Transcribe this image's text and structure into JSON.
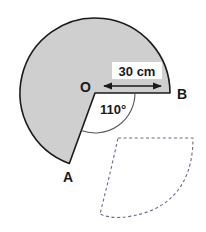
{
  "figure": {
    "background_color": "#ffffff",
    "sector": {
      "fill_color": "#cfcfcf",
      "stroke_color": "#1a1a1a",
      "center_label": "O",
      "start_point_label": "A",
      "end_point_label": "B",
      "radius_cm": 30,
      "removed_angle_degrees": 110,
      "shaded_angle_degrees": 250
    },
    "labels": {
      "center": "O",
      "point_a": "A",
      "point_b": "B",
      "radius_dimension": "30 cm",
      "angle": "110°"
    },
    "dimension_line": {
      "label": "30 cm",
      "from_label": "O",
      "to_label": "B",
      "arrow_style": "double-headed",
      "stroke_color": "#1a1a1a"
    },
    "angle_marker": {
      "label": "110°",
      "arc_stroke_color": "#4d4d4d",
      "value_degrees": 110
    },
    "dashed_shape": {
      "name": "cone-net-outline",
      "stroke_color": "#6b6b8a",
      "stroke_style": "dashed",
      "fill": "none"
    }
  }
}
